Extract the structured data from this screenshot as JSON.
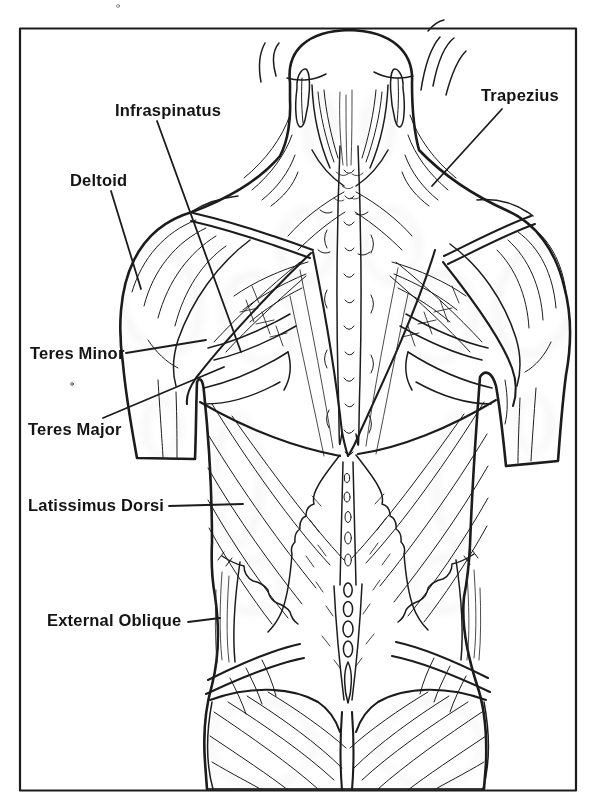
{
  "page": {
    "figure_type": "Posterior trunk muscle anatomy diagram",
    "labels": [
      {
        "id": "infraspinatus",
        "text": "Infraspinatus"
      },
      {
        "id": "trapezius",
        "text": "Trapezius"
      },
      {
        "id": "deltoid",
        "text": "Deltoid"
      },
      {
        "id": "teres_minor",
        "text": "Teres Minor"
      },
      {
        "id": "teres_major",
        "text": "Teres Major"
      },
      {
        "id": "latissimus_dorsi",
        "text": "Latissimus Dorsi"
      },
      {
        "id": "external_oblique",
        "text": "External Oblique"
      }
    ],
    "colors": {
      "ink": "#1c1c1c",
      "paper": "#ffffff",
      "stipple": "#8b8b8b"
    }
  }
}
